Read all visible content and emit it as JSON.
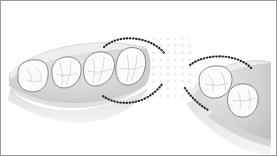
{
  "figure": {
    "title": "Posterior edentulous space with surveyed abutment teeth",
    "caption": "",
    "width": 277,
    "height": 156,
    "background_color": "#ffffff",
    "border_color": "#9a9a9a"
  },
  "legend": {
    "items": [
      {
        "name": "gingival-ridge",
        "label": "Edentulous alveolar ridge",
        "color": "#d2d2d2"
      },
      {
        "name": "tooth-crown",
        "label": "Tooth occlusal surface",
        "color": "#fbfbfb"
      },
      {
        "name": "survey-line",
        "label": "Surveyed outline (dotted)",
        "color": "#262626"
      },
      {
        "name": "stipple-field",
        "label": "Stippled edentulous area",
        "color": "#e9e9e9"
      }
    ]
  },
  "arch": {
    "left_segment": {
      "name": "left-tooth-group",
      "label": "Mesial tooth group",
      "tooth_count": 4,
      "teeth": [
        {
          "id": "L1",
          "label": "Premolar",
          "shape": "rounded-square"
        },
        {
          "id": "L2",
          "label": "Premolar",
          "shape": "triangular"
        },
        {
          "id": "L3",
          "label": "Molar",
          "shape": "triangular"
        },
        {
          "id": "L4",
          "label": "Terminal abutment molar",
          "shape": "triangular",
          "surveyed": true
        }
      ]
    },
    "right_segment": {
      "name": "right-tooth-group",
      "label": "Distal tooth group",
      "tooth_count": 2,
      "teeth": [
        {
          "id": "R1",
          "label": "Abutment molar",
          "shape": "rounded-square",
          "surveyed": true
        },
        {
          "id": "R2",
          "label": "Molar",
          "shape": "rounded-square"
        }
      ]
    },
    "edentulous_span": {
      "name": "edentulous-space",
      "label": "Edentulous span",
      "fill": "stipple"
    }
  },
  "survey_lines": {
    "terminal_buccal": {
      "label": "Buccal survey line, terminal abutment"
    },
    "terminal_lingual": {
      "label": "Lingual survey line, terminal abutment"
    },
    "right_buccal": {
      "label": "Buccal survey line, distal abutment"
    },
    "right_lingual": {
      "label": "Lingual survey line, distal abutment"
    }
  },
  "colors": {
    "ridge_light": "#e4e4e4",
    "ridge_mid": "#d2d2d2",
    "ridge_dark": "#bdbdbd",
    "tooth_fill": "#fbfbfb",
    "tooth_stroke": "#7d7d7d",
    "fissure": "#c9c9c9",
    "dot": "#262626",
    "stipple": "#e9e9e9"
  }
}
